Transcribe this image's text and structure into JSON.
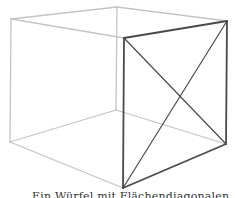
{
  "diagram": {
    "type": "wireframe-cube",
    "colors": {
      "back_edges": "#c4c4c4",
      "front_face": "#4a4a4a",
      "background": "#ffffff"
    },
    "vertices": {
      "back_top_left": [
        11,
        19
      ],
      "back_top_right": [
        117,
        7
      ],
      "front_top_left": [
        124,
        38
      ],
      "front_top_right": [
        227,
        21
      ],
      "back_bottom_left": [
        10,
        142
      ],
      "back_bottom_right": [
        116,
        110
      ],
      "front_bottom_left": [
        123,
        188
      ],
      "front_bottom_right": [
        226,
        144
      ]
    },
    "light_edges": [
      [
        "back_top_left",
        "back_top_right"
      ],
      [
        "back_top_left",
        "front_top_left"
      ],
      [
        "back_top_right",
        "front_top_right"
      ],
      [
        "back_top_left",
        "back_bottom_left"
      ],
      [
        "back_top_right",
        "back_bottom_right"
      ],
      [
        "back_bottom_left",
        "back_bottom_right"
      ],
      [
        "back_bottom_left",
        "front_bottom_left"
      ],
      [
        "back_bottom_right",
        "front_bottom_right"
      ]
    ],
    "highlighted_face_edges": [
      [
        "front_top_left",
        "front_top_right"
      ],
      [
        "front_top_right",
        "front_bottom_right"
      ],
      [
        "front_bottom_right",
        "front_bottom_left"
      ],
      [
        "front_bottom_left",
        "front_top_left"
      ]
    ],
    "diagonals": [
      [
        "front_top_left",
        "front_bottom_right"
      ],
      [
        "front_top_right",
        "front_bottom_left"
      ]
    ]
  },
  "caption": {
    "text": "Ein Würfel mit Flächendiagonalen"
  }
}
